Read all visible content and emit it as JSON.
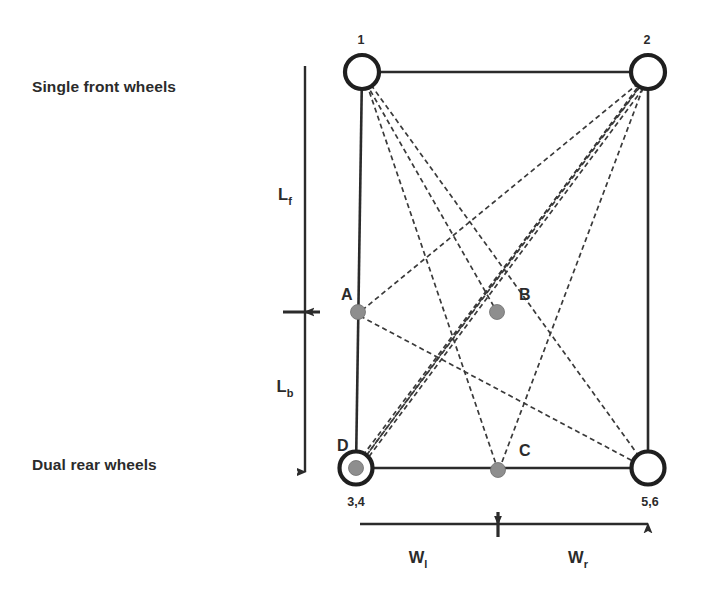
{
  "figure": {
    "background_color": "#ffffff",
    "line_color": "#2b2b2b",
    "dashed_line_color": "#3a3a3a",
    "node_fill_color": "#8e8e8e"
  },
  "side_labels": {
    "front": "Single front wheels",
    "rear": "Dual rear wheels"
  },
  "wheel_nodes": [
    {
      "id": "w1",
      "number": "1",
      "x": 362,
      "y": 72,
      "radius": 17,
      "filled": false,
      "label_x": 361,
      "label_y": 44,
      "label_anchor": "middle"
    },
    {
      "id": "w2",
      "number": "2",
      "x": 648,
      "y": 72,
      "radius": 17,
      "filled": false,
      "label_x": 647,
      "label_y": 44,
      "label_anchor": "middle"
    },
    {
      "id": "w34",
      "number": "3,4",
      "x": 356,
      "y": 468,
      "radius": 16.5,
      "filled": true,
      "label_x": 356,
      "label_y": 506,
      "label_anchor": "middle"
    },
    {
      "id": "w56",
      "number": "5,6",
      "x": 648,
      "y": 468,
      "radius": 16.5,
      "filled": false,
      "label_x": 650,
      "label_y": 506,
      "label_anchor": "middle"
    }
  ],
  "interior_points": [
    {
      "id": "A",
      "label": "A",
      "x": 358,
      "y": 312,
      "radius": 7.5,
      "label_x": 341,
      "label_y": 300
    },
    {
      "id": "B",
      "label": "B",
      "x": 497,
      "y": 312,
      "radius": 7.5,
      "label_x": 519,
      "label_y": 300
    },
    {
      "id": "C",
      "label": "C",
      "x": 498,
      "y": 470,
      "radius": 7.5,
      "label_x": 519,
      "label_y": 456
    },
    {
      "id": "D",
      "label": "D",
      "x": 356,
      "y": 468,
      "radius": 7.5,
      "label_x": 337,
      "label_y": 451
    }
  ],
  "frame_edges": [
    {
      "name": "top-edge",
      "x1": 362,
      "y1": 72,
      "x2": 648,
      "y2": 72
    },
    {
      "name": "left-edge",
      "x1": 362,
      "y1": 72,
      "x2": 356,
      "y2": 468
    },
    {
      "name": "right-edge",
      "x1": 648,
      "y1": 72,
      "x2": 648,
      "y2": 468
    },
    {
      "name": "bottom-edge",
      "x1": 356,
      "y1": 468,
      "x2": 648,
      "y2": 468
    }
  ],
  "dashed_connections": [
    {
      "name": "w1-to-B",
      "x1": 362,
      "y1": 76,
      "x2": 497,
      "y2": 312
    },
    {
      "name": "w1-to-C",
      "x1": 364,
      "y1": 76,
      "x2": 498,
      "y2": 470
    },
    {
      "name": "w1-to-w56",
      "x1": 366,
      "y1": 78,
      "x2": 646,
      "y2": 466
    },
    {
      "name": "w2-to-A",
      "x1": 645,
      "y1": 78,
      "x2": 360,
      "y2": 312
    },
    {
      "name": "w2-to-D",
      "x1": 645,
      "y1": 80,
      "x2": 360,
      "y2": 464
    },
    {
      "name": "w2-to-D2",
      "x1": 648,
      "y1": 82,
      "x2": 362,
      "y2": 466
    },
    {
      "name": "w2-to-C",
      "x1": 646,
      "y1": 80,
      "x2": 499,
      "y2": 470
    },
    {
      "name": "w2-to-w34",
      "x1": 643,
      "y1": 82,
      "x2": 358,
      "y2": 462
    },
    {
      "name": "A-to-w2b",
      "x1": 360,
      "y1": 316,
      "x2": 646,
      "y2": 468
    },
    {
      "name": "D-to-B",
      "x1": 360,
      "y1": 464,
      "x2": 646,
      "y2": 76
    }
  ],
  "vertical_dimension": {
    "axis_x": 305,
    "top_tip_y": 66,
    "bottom_tip_y": 472,
    "tick_y": 312,
    "tick_x1": 283,
    "tick_x2": 320,
    "upper_label": "L",
    "upper_sub": "f",
    "upper_label_x": 285,
    "upper_label_y": 200,
    "lower_label": "L",
    "lower_sub": "b",
    "lower_label_x": 285,
    "lower_label_y": 392
  },
  "horizontal_dimension": {
    "axis_y": 524,
    "left_tip_x": 360,
    "right_tip_x": 648,
    "tick_x": 498,
    "tick_y1": 512,
    "tick_y2": 537,
    "left_label": "W",
    "left_sub": "l",
    "left_label_x": 418,
    "left_label_y": 563,
    "right_label": "W",
    "right_sub": "r",
    "right_label_x": 578,
    "right_label_y": 563
  }
}
